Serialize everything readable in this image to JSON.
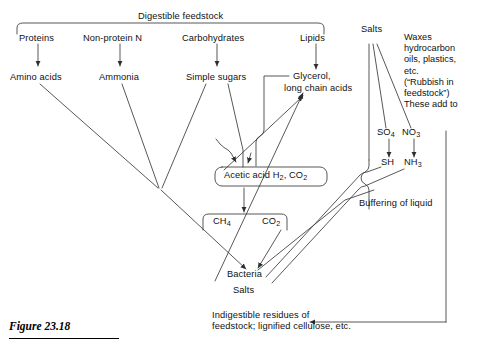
{
  "figure": {
    "caption": "Figure 23.18",
    "title": "Digestible feedstock"
  },
  "feedstock_row": [
    {
      "label": "Proteins"
    },
    {
      "label": "Non-protein N"
    },
    {
      "label": "Carbohydrates"
    },
    {
      "label": "Lipids"
    }
  ],
  "products_row": [
    {
      "label": "Amino acids"
    },
    {
      "label": "Ammonia"
    },
    {
      "label": "Simple sugars"
    }
  ],
  "lipid_products": {
    "line1": "Glycerol,",
    "line2": "long chain acids"
  },
  "salts": {
    "label": "Salts",
    "so4": "SO",
    "so4_sub": "4",
    "no3": "NO",
    "no3_sub": "3",
    "sh": "SH",
    "nh3": "NH",
    "nh3_sub": "3",
    "buffering": "Buffering of liquid"
  },
  "acetic_box": {
    "text_a": "Acetic acid H",
    "sub_a": "2",
    "text_b": ", CO",
    "sub_b": "2"
  },
  "gas_box": {
    "ch4": "CH",
    "ch4_sub": "4",
    "co2": "CO",
    "co2_sub": "2"
  },
  "bacteria": {
    "label": "Bacteria",
    "salts_label": "Salts"
  },
  "residues": {
    "line1": "Indigestible residues of",
    "line2": "feedstock; lignified cellulose, etc."
  },
  "rubbish": {
    "lines": "Waxes hydrocarbon oils, plastics, etc. (“Rubbish in feedstock”) These add to"
  },
  "rubbish_lines": [
    "Waxes",
    "hydrocarbon",
    "oils, plastics,",
    "etc.",
    "(“Rubbish in",
    "feedstock”)",
    "These add to"
  ],
  "colors": {
    "ink": "#111111",
    "line": "#3a3a3a",
    "background": "#ffffff"
  }
}
